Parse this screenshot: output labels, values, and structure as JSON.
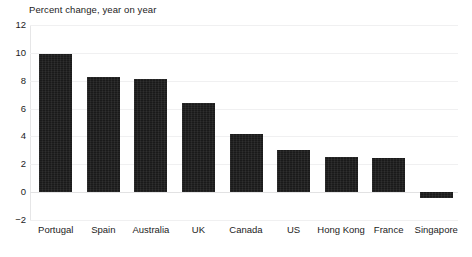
{
  "chart_data": {
    "type": "bar",
    "title": "Percent change, year on year",
    "xlabel": "",
    "ylabel": "",
    "ylim": [
      -2,
      12
    ],
    "yticks": [
      -2,
      0,
      2,
      4,
      6,
      8,
      10,
      12
    ],
    "ytick_labels": [
      "−2",
      "0",
      "2",
      "4",
      "6",
      "8",
      "10",
      "12"
    ],
    "grid": true,
    "legend": false,
    "orientation": "vertical",
    "bar_color": "#1a1a1a",
    "categories": [
      "Portugal",
      "Spain",
      "Australia",
      "UK",
      "Canada",
      "US",
      "Hong Kong",
      "France",
      "Singapore"
    ],
    "values": [
      9.95,
      8.3,
      8.1,
      6.4,
      4.2,
      3.0,
      2.5,
      2.45,
      -0.45
    ]
  },
  "caption": {
    "partial_text": ""
  }
}
